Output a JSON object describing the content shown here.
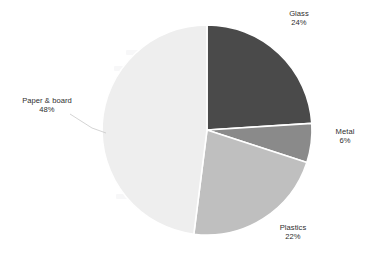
{
  "chart_data": {
    "type": "pie",
    "title": "",
    "subtitle": "",
    "xlabel": "",
    "ylabel": "",
    "legend_position": "none",
    "grid": false,
    "label_format": "name-over-percent",
    "start_angle_deg": 0,
    "direction": "clockwise",
    "categories": [
      "Glass",
      "Metal",
      "Plastics",
      "Paper & board"
    ],
    "values": [
      24,
      6,
      22,
      48
    ],
    "value_labels": [
      "24%",
      "6%",
      "22%",
      "48%"
    ],
    "unit": "%",
    "colors": [
      "#4a4a4a",
      "#8a8a8a",
      "#bfbfbf",
      "#eeeeee"
    ],
    "slices": [
      {
        "name": "Glass",
        "value": 24,
        "value_label": "24%",
        "color": "#4a4a4a",
        "start_deg": 0,
        "end_deg": 86.4,
        "label_position": "outside-top-right"
      },
      {
        "name": "Metal",
        "value": 6,
        "value_label": "6%",
        "color": "#8a8a8a",
        "start_deg": 86.4,
        "end_deg": 108.0,
        "label_position": "outside-right"
      },
      {
        "name": "Plastics",
        "value": 22,
        "value_label": "22%",
        "color": "#bfbfbf",
        "start_deg": 108.0,
        "end_deg": 187.2,
        "label_position": "outside-bottom-right"
      },
      {
        "name": "Paper & board",
        "value": 48,
        "value_label": "48%",
        "color": "#eeeeee",
        "start_deg": 187.2,
        "end_deg": 360.0,
        "label_position": "outside-left"
      }
    ],
    "geometry": {
      "center_x": 207,
      "center_y": 130,
      "radius": 105,
      "separator_color": "#ffffff"
    }
  },
  "labels": {
    "glass": {
      "name": "Glass",
      "value": "24%"
    },
    "metal": {
      "name": "Metal",
      "value": "6%"
    },
    "plastics": {
      "name": "Plastics",
      "value": "22%"
    },
    "paper": {
      "name": "Paper & board",
      "value": "48%"
    }
  }
}
